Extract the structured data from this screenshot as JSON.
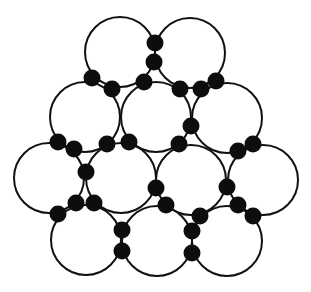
{
  "diagram": {
    "colors": {
      "background": "#ffffff",
      "large_fill": "#ffffff",
      "large_stroke": "#111111",
      "small_fill": "#0d0d0d"
    },
    "large_radius": 35,
    "small_radius": 8.5,
    "large_spheres": [
      {
        "row": 1,
        "cx": 120,
        "cy": 52
      },
      {
        "row": 1,
        "cx": 190,
        "cy": 53
      },
      {
        "row": 2,
        "cx": 85,
        "cy": 117
      },
      {
        "row": 2,
        "cx": 156,
        "cy": 117
      },
      {
        "row": 2,
        "cx": 227,
        "cy": 118
      },
      {
        "row": 3,
        "cx": 49,
        "cy": 178
      },
      {
        "row": 3,
        "cx": 121,
        "cy": 178
      },
      {
        "row": 3,
        "cx": 191,
        "cy": 180
      },
      {
        "row": 3,
        "cx": 263,
        "cy": 180
      },
      {
        "row": 4,
        "cx": 86,
        "cy": 240
      },
      {
        "row": 4,
        "cx": 157,
        "cy": 241
      },
      {
        "row": 4,
        "cx": 227,
        "cy": 241
      }
    ],
    "small_spheres": [
      {
        "cx": 155,
        "cy": 43
      },
      {
        "cx": 154,
        "cy": 62
      },
      {
        "cx": 92,
        "cy": 78
      },
      {
        "cx": 112,
        "cy": 89
      },
      {
        "cx": 144,
        "cy": 82
      },
      {
        "cx": 180,
        "cy": 89
      },
      {
        "cx": 201,
        "cy": 89
      },
      {
        "cx": 216,
        "cy": 81
      },
      {
        "cx": 191,
        "cy": 126
      },
      {
        "cx": 58,
        "cy": 142
      },
      {
        "cx": 74,
        "cy": 149
      },
      {
        "cx": 107,
        "cy": 144
      },
      {
        "cx": 129,
        "cy": 142
      },
      {
        "cx": 179,
        "cy": 144
      },
      {
        "cx": 253,
        "cy": 144
      },
      {
        "cx": 238,
        "cy": 151
      },
      {
        "cx": 86,
        "cy": 172
      },
      {
        "cx": 156,
        "cy": 188
      },
      {
        "cx": 227,
        "cy": 187
      },
      {
        "cx": 76,
        "cy": 203
      },
      {
        "cx": 94,
        "cy": 203
      },
      {
        "cx": 58,
        "cy": 214
      },
      {
        "cx": 166,
        "cy": 205
      },
      {
        "cx": 200,
        "cy": 216
      },
      {
        "cx": 238,
        "cy": 205
      },
      {
        "cx": 253,
        "cy": 216
      },
      {
        "cx": 122,
        "cy": 230
      },
      {
        "cx": 122,
        "cy": 251
      },
      {
        "cx": 192,
        "cy": 231
      },
      {
        "cx": 192,
        "cy": 253
      }
    ]
  }
}
